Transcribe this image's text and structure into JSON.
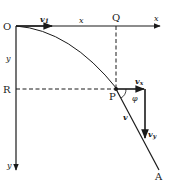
{
  "diagram": {
    "type": "projectile-motion",
    "labels": {
      "origin": "O",
      "point_q": "Q",
      "point_r": "R",
      "point_p": "P",
      "point_a": "A",
      "x_axis": "x",
      "x_segment": "x",
      "y_axis": "y",
      "y_segment": "y",
      "initial_velocity": "v",
      "initial_velocity_sub": "1",
      "velocity": "v",
      "velocity_x": "v",
      "velocity_x_sub": "x",
      "velocity_y": "v",
      "velocity_y_sub": "y",
      "angle": "φ"
    },
    "colors": {
      "ink": "#1a1a1a",
      "background": "#ffffff"
    }
  }
}
